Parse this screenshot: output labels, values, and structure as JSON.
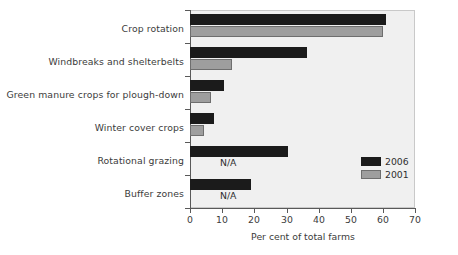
{
  "chart_data": {
    "type": "bar",
    "orientation": "horizontal",
    "title": "",
    "xlabel": "Per cent of total farms",
    "ylabel": "",
    "xlim": [
      0,
      70
    ],
    "xticks": [
      0,
      10,
      20,
      30,
      40,
      50,
      60,
      70
    ],
    "grid": false,
    "legend_position": "right-middle",
    "categories": [
      "Crop rotation",
      "Windbreaks and shelterbelts",
      "Green manure crops for plough-down",
      "Winter cover crops",
      "Rotational grazing",
      "Buffer zones"
    ],
    "series": [
      {
        "name": "2006",
        "color": "#1b1b1b",
        "values": [
          61,
          36.5,
          10.5,
          7.5,
          30.5,
          19
        ]
      },
      {
        "name": "2001",
        "color": "#9e9e9e",
        "values": [
          60,
          13,
          6.5,
          4.5,
          null,
          null
        ],
        "missing_label": "N/A"
      }
    ],
    "annotations": [
      {
        "text": "N/A",
        "category": "Rotational grazing",
        "series": "2001"
      },
      {
        "text": "N/A",
        "category": "Buffer zones",
        "series": "2001"
      }
    ]
  },
  "axis": {
    "x_tick_labels": [
      "0",
      "10",
      "20",
      "30",
      "40",
      "50",
      "60",
      "70"
    ],
    "x_title": "Per cent of total farms"
  },
  "legend": {
    "entries": [
      {
        "label": "2006",
        "color": "#1b1b1b"
      },
      {
        "label": "2001",
        "color": "#9e9e9e"
      }
    ]
  },
  "colors": {
    "series_2006": "#1b1b1b",
    "series_2001": "#9e9e9e",
    "plot_background": "#f0f0f0",
    "axis": "#595959",
    "text": "#3b3b3b"
  }
}
